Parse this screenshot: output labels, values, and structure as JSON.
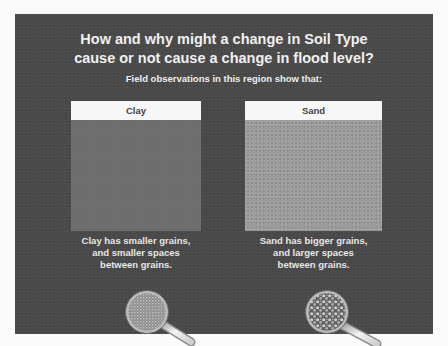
{
  "slide": {
    "title_line1": "How and why might a change in Soil Type",
    "title_line2": "cause or not cause a change in flood level?",
    "subtitle": "Field observations in this region show that:",
    "colors": {
      "background": "#4a4a4a",
      "clay_fill": "#6c6c6c",
      "sand_fill": "#9d9d9d",
      "header_fill": "#f7f7f7",
      "text": "#f0f0f0"
    }
  },
  "panels": [
    {
      "label": "Clay",
      "caption_line1": "Clay has smaller grains,",
      "caption_line2": "and smaller spaces",
      "caption_line3": "between grains.",
      "icon": "magnifying-glass-fine-grains-icon"
    },
    {
      "label": "Sand",
      "caption_line1": "Sand has bigger grains,",
      "caption_line2": "and larger spaces",
      "caption_line3": "between grains.",
      "icon": "magnifying-glass-coarse-grains-icon"
    }
  ]
}
